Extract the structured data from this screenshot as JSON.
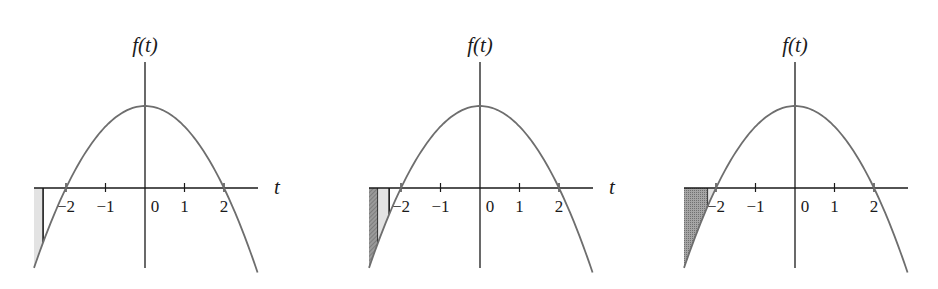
{
  "figure": {
    "function": "f(t) = 4 - t^2",
    "y_axis_label": "f(t)",
    "x_axis_label": "t",
    "tick_labels": [
      "−2",
      "−1",
      "0",
      "1",
      "2"
    ],
    "tick_values": [
      -2,
      -1,
      0,
      1,
      2
    ],
    "curve_color": "#6e6e6e",
    "axis_color": "#1a1a1a",
    "light_fill": "#e3e3e3",
    "dark_fill": "#8a8a8a"
  },
  "panels": [
    {
      "id": "panel-1",
      "offset_x": 0,
      "y_axis_x": 145,
      "shaded": [
        {
          "kind": "light",
          "t_from": -2.81,
          "t_to": -2.58
        }
      ],
      "x_label_visible": true
    },
    {
      "id": "panel-2",
      "offset_x": 332,
      "y_axis_x": 148,
      "shaded": [
        {
          "kind": "dark",
          "t_from": -2.81,
          "t_to": -2.58
        },
        {
          "kind": "light",
          "t_from": -2.58,
          "t_to": -2.3
        }
      ],
      "x_label_visible": true
    },
    {
      "id": "panel-3",
      "offset_x": 650,
      "y_axis_x": 145,
      "shaded": [
        {
          "kind": "dark",
          "t_from": -2.81,
          "t_to": -2.2
        },
        {
          "kind": "light",
          "t_from": -2.2,
          "t_to": -2.0
        }
      ],
      "x_label_visible": false
    }
  ],
  "chart_data": [
    {
      "type": "line",
      "title": "",
      "xlabel": "t",
      "ylabel": "f(t)",
      "x_ticks": [
        -2,
        -1,
        0,
        1,
        2
      ],
      "xlim": [
        -2.81,
        2.85
      ],
      "ylim": [
        -3.9,
        5.2
      ],
      "series": [
        {
          "name": "f(t)",
          "x": [
            -2.8,
            -2,
            -1,
            0,
            1,
            2,
            2.8
          ],
          "values": [
            -3.84,
            0,
            3,
            4,
            3,
            0,
            -3.84
          ]
        }
      ],
      "shaded_regions": [
        {
          "kind": "light",
          "t_from": -2.81,
          "t_to": -2.58
        }
      ],
      "grid": false
    },
    {
      "type": "line",
      "title": "",
      "xlabel": "t",
      "ylabel": "f(t)",
      "x_ticks": [
        -2,
        -1,
        0,
        1,
        2
      ],
      "xlim": [
        -2.81,
        2.85
      ],
      "ylim": [
        -3.9,
        5.2
      ],
      "series": [
        {
          "name": "f(t)",
          "x": [
            -2.8,
            -2,
            -1,
            0,
            1,
            2,
            2.8
          ],
          "values": [
            -3.84,
            0,
            3,
            4,
            3,
            0,
            -3.84
          ]
        }
      ],
      "shaded_regions": [
        {
          "kind": "dark",
          "t_from": -2.81,
          "t_to": -2.58
        },
        {
          "kind": "light",
          "t_from": -2.58,
          "t_to": -2.3
        }
      ],
      "grid": false
    },
    {
      "type": "line",
      "title": "",
      "xlabel": "t",
      "ylabel": "f(t)",
      "x_ticks": [
        -2,
        -1,
        0,
        1,
        2
      ],
      "xlim": [
        -2.81,
        2.85
      ],
      "ylim": [
        -3.9,
        5.2
      ],
      "series": [
        {
          "name": "f(t)",
          "x": [
            -2.8,
            -2,
            -1,
            0,
            1,
            2,
            2.8
          ],
          "values": [
            -3.84,
            0,
            3,
            4,
            3,
            0,
            -3.84
          ]
        }
      ],
      "shaded_regions": [
        {
          "kind": "dark",
          "t_from": -2.81,
          "t_to": -2.2
        },
        {
          "kind": "light",
          "t_from": -2.2,
          "t_to": -2.0
        }
      ],
      "grid": false
    }
  ]
}
